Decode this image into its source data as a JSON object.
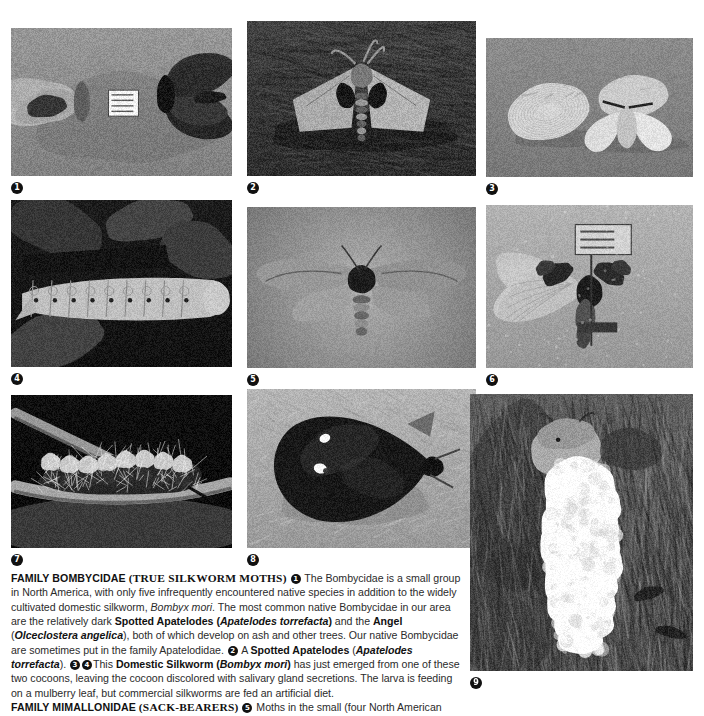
{
  "page": {
    "type": "field-guide-plate",
    "background": "#ffffff",
    "text_color": "#2b2b2b"
  },
  "figures": [
    {
      "number": "1",
      "name": "spotted-apatelodes-and-angel-specimens",
      "caption_ref": "Two pinned moth specimens with data label",
      "scene": "pinned-specimens-pale-background",
      "x": 11,
      "y": 28,
      "w": 221,
      "h": 148
    },
    {
      "number": "2",
      "name": "spotted-apatelodes-on-bark",
      "caption_ref": "A Spotted Apatelodes at rest on wood",
      "scene": "moth-on-dark-bark",
      "x": 247,
      "y": 21,
      "w": 229,
      "h": 155
    },
    {
      "number": "3",
      "name": "domestic-silkworm-with-cocoons",
      "caption_ref": "Domestic Silkworm newly emerged beside cocoons",
      "scene": "cocoon-and-pale-moth",
      "x": 486,
      "y": 38,
      "w": 207,
      "h": 139
    },
    {
      "number": "4",
      "name": "domestic-silkworm-larva",
      "caption_ref": "Silkworm larva feeding on mulberry leaf",
      "scene": "pale-caterpillar-dark-background",
      "x": 11,
      "y": 200,
      "w": 221,
      "h": 167
    },
    {
      "number": "5",
      "name": "mimallonidae-sack-bearer-moth",
      "caption_ref": "Sack-bearer moth, spread specimen",
      "scene": "spread-moth-gray-background",
      "x": 247,
      "y": 207,
      "w": 229,
      "h": 161
    },
    {
      "number": "6",
      "name": "pinned-moth-specimen-with-label",
      "caption_ref": "Pinned moth specimen with collection label",
      "scene": "pinned-specimen-pale-wings",
      "x": 486,
      "y": 205,
      "w": 207,
      "h": 163
    },
    {
      "number": "7",
      "name": "hairy-caterpillar-on-branch",
      "caption_ref": "Tussock-like caterpillar on a twig",
      "scene": "bristly-caterpillar-on-branch",
      "x": 11,
      "y": 395,
      "w": 221,
      "h": 153
    },
    {
      "number": "8",
      "name": "dark-moth-with-white-spots",
      "caption_ref": "Dark moth at rest with two white spots",
      "scene": "dark-triangular-moth-on-pale-ground",
      "x": 247,
      "y": 389,
      "w": 229,
      "h": 159
    },
    {
      "number": "9",
      "name": "moth-with-white-egg-mass-on-bark",
      "caption_ref": "Moth depositing a frothy white egg mass on tree bark",
      "scene": "egg-mass-on-bark",
      "x": 470,
      "y": 394,
      "w": 223,
      "h": 277
    }
  ],
  "body": {
    "family_bombycidae": {
      "heading_bold": "FAMILY BOMBYCIDAE",
      "heading_smallcaps": "(TRUE SILKWORM MOTHS)",
      "ref1": "1",
      "seg1": " The Bombycidae is a small group in North America, with only five infrequently encountered native species in addition to the widely cultivated domestic silkworm, ",
      "sp1": "Bombyx mori",
      "seg2": ". The most common native Bombycidae in our area are the relatively dark ",
      "b1": "Spotted Apatelodes (",
      "bi1": "Apatelodes torrefacta",
      "b2": ")",
      "seg3": " and the ",
      "b3": "Angel",
      "seg4": " (",
      "bi2": "Olceclostera angelica",
      "seg5": "), both of which develop on ash and other trees. Our native Bombycidae are sometimes put in the family Apatelodidae. ",
      "ref2": "2",
      "seg6": " A ",
      "b4": "Spotted Apatelodes",
      "seg7": " (",
      "bi3": "Apatelodes torrefacta",
      "seg8": "). ",
      "ref3": "3",
      "ref4": "4",
      "seg9": "This ",
      "b5": "Domestic Silkworm (",
      "bi4": "Bombyx mori",
      "b6": ")",
      "seg10": "  has just emerged from one of these two cocoons, leaving the cocoon discolored with salivary gland secretions. The larva is feeding on a mulberry leaf, but commercial silkworms are fed an artificial diet."
    },
    "family_mimallonidae": {
      "heading_bold": "FAMILY MIMALLONIDAE",
      "heading_smallcaps": "(SACK-BEARERS)",
      "ref5": "5",
      "seg1": " Moths in the small (four North American"
    }
  }
}
